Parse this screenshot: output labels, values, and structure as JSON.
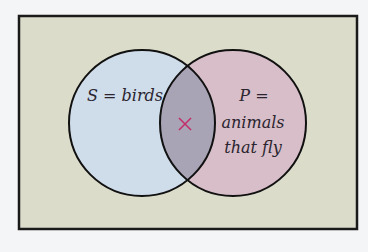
{
  "diagram": {
    "type": "venn",
    "universe": {
      "fill": "#dcdccb",
      "border": "#1a1a1a"
    },
    "sets": [
      {
        "id": "S",
        "label": "S = birds",
        "fill": "#cfdce9"
      },
      {
        "id": "P",
        "label_line1": "P =",
        "label_line2": "animals",
        "label_line3": "that fly",
        "fill": "#d8bec8"
      }
    ],
    "intersection": {
      "fill": "#a9a3b6",
      "marker": "×",
      "marker_color": "#c0306a"
    }
  }
}
